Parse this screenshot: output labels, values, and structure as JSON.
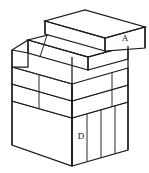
{
  "figure": {
    "type": "line-drawing",
    "width": 149,
    "height": 173,
    "background_color": "#ffffff",
    "line_color": "#1a1a1a",
    "face_fill_color": "#ffffff"
  },
  "labels": {
    "a": "A",
    "b": "B",
    "c": "C",
    "d": "D"
  },
  "label_positions": {
    "a": {
      "x": 125,
      "y": 39
    },
    "b": {
      "x": 96,
      "y": 65
    },
    "c": {
      "x": 95,
      "y": 84
    },
    "d": {
      "x": 81,
      "y": 137
    }
  },
  "blocks": [
    {
      "id": "A",
      "label": "A",
      "description": "Top slab, offset toward the back-right, highest tier",
      "tier": 1,
      "label_face": "right"
    },
    {
      "id": "B",
      "label": "B",
      "description": "Second tier slab, front-left offset relative to A",
      "tier": 2,
      "label_face": "right"
    },
    {
      "id": "C",
      "label": "C",
      "description": "Third tier slab, flush with tier two front edge",
      "tier": 3,
      "label_face": "right"
    },
    {
      "id": "D",
      "label": "D",
      "description": "Bottom large base block with four vertical panel divisions on right face",
      "tier": 4,
      "label_face": "right",
      "right_face_panel_count": 4
    }
  ],
  "geometry_note": "Axonometric projection; vertical edges drawn vertical, receding edges drawn at a shallow upward-right slope."
}
